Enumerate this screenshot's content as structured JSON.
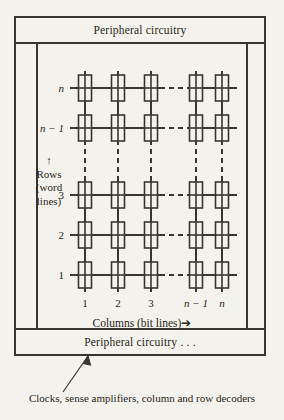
{
  "figure": {
    "background_color": "#f3f2ec",
    "ink_color": "#3b362d"
  },
  "periph_top": {
    "label": "Peripheral circuitry"
  },
  "periph_bottom": {
    "label": "Peripheral circuitry . . ."
  },
  "rows": {
    "axis_caption_line1": "Rows",
    "axis_caption_line2": "(word",
    "axis_caption_line3": "lines)",
    "arrow_glyph": "↑",
    "labels": [
      {
        "text": "n",
        "italic": true,
        "y": 88
      },
      {
        "text": "n − 1",
        "italic": true,
        "y": 128
      },
      {
        "text": "3",
        "italic": false,
        "y": 195
      },
      {
        "text": "2",
        "italic": false,
        "y": 235
      },
      {
        "text": "1",
        "italic": false,
        "y": 275
      }
    ]
  },
  "columns": {
    "caption": "Columns (bit lines)➔",
    "labels": [
      {
        "text": "1",
        "italic": false,
        "x": 85
      },
      {
        "text": "2",
        "italic": false,
        "x": 118
      },
      {
        "text": "3",
        "italic": false,
        "x": 151
      },
      {
        "text": "n − 1",
        "italic": true,
        "x": 196
      },
      {
        "text": "n",
        "italic": true,
        "x": 222
      }
    ]
  },
  "caption": {
    "text": "Clocks, sense amplifiers, column and row decoders"
  },
  "chart_data": {
    "type": "diagram",
    "cell_rows_y": [
      88,
      128,
      195,
      235,
      275
    ],
    "cell_cols_x": [
      85,
      118,
      151,
      196,
      222
    ],
    "cell_box": {
      "width": 13,
      "height": 26
    },
    "row_line_x_start": 70,
    "row_line_x_end": 237,
    "col_line_y_start": 71,
    "col_line_y_end": 292,
    "row_dash_gap_x": [
      160,
      188
    ],
    "col_dash_gap_y": [
      140,
      184
    ],
    "grid": false,
    "legend": "none"
  }
}
